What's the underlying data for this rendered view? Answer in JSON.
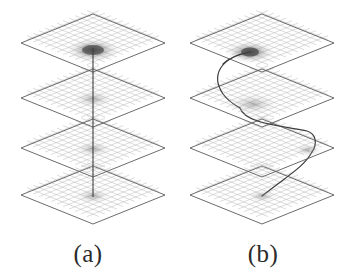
{
  "figure": {
    "width": 351,
    "height": 276,
    "background_color": "#ffffff",
    "panel_count": 2
  },
  "panels": [
    {
      "id": "a",
      "caption": "(a)",
      "description": "four stacked isometric grid planes pierced by a straight vertical line",
      "path_type": "straight-vertical",
      "plane_count": 4
    },
    {
      "id": "b",
      "caption": "(b)",
      "description": "four stacked isometric grid planes pierced by a meandering curved path",
      "path_type": "curved-meander",
      "plane_count": 4
    }
  ],
  "style": {
    "grid_line_color": "#9a9a9a",
    "grid_minor_color": "#bdbdbd",
    "plane_edge_color": "#555555",
    "path_color": "#3a3a3a",
    "blob_color": "#4a4a4a",
    "caption_color": "#2b2b2b"
  },
  "geometry": {
    "plane_half_width": 72,
    "plane_half_height": 29,
    "grid_divisions": 12,
    "panel_a_center_x": 93,
    "panel_b_center_x": 262,
    "plane_center_ys": [
      43,
      98,
      148,
      195
    ]
  },
  "panel_a_path": {
    "type": "vertical-line",
    "start": [
      93,
      48
    ],
    "end": [
      93,
      197
    ],
    "blob_at": [
      93,
      50
    ],
    "blob_plane_index": 0
  },
  "panel_b_path": {
    "type": "bezier-curve",
    "start": [
      250,
      52
    ],
    "end": [
      262,
      196
    ],
    "blob_at": [
      250,
      52
    ],
    "blob_plane_index": 0,
    "waypoints": [
      [
        250,
        52
      ],
      [
        205,
        62
      ],
      [
        196,
        108
      ],
      [
        240,
        122
      ],
      [
        300,
        128
      ],
      [
        312,
        152
      ],
      [
        282,
        170
      ],
      [
        262,
        196
      ]
    ]
  }
}
